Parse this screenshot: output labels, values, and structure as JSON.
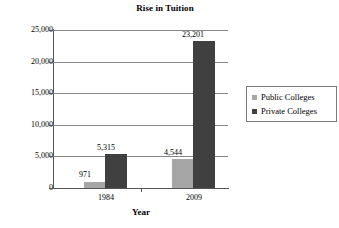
{
  "chart_data": {
    "type": "bar",
    "title": "Rise in Tuition",
    "xlabel": "Year",
    "ylabel": "Dollars",
    "categories": [
      "1984",
      "2009"
    ],
    "series": [
      {
        "name": "Public Colleges",
        "color": "#a6a6a6",
        "values": [
          971,
          4544
        ]
      },
      {
        "name": "Private Colleges",
        "color": "#404040",
        "values": [
          5315,
          23201
        ]
      }
    ],
    "value_labels": [
      {
        "text": "971",
        "value": 971
      },
      {
        "text": "5,315",
        "value": 5315
      },
      {
        "text": "4,544",
        "value": 4544
      },
      {
        "text": "23,201",
        "value": 23201
      }
    ],
    "ylim": [
      0,
      25000
    ],
    "ytick_values": [
      0,
      5000,
      10000,
      15000,
      20000,
      25000
    ],
    "ytick_labels": [
      "0",
      "5,000",
      "10,000",
      "15,000",
      "20,000",
      "25,000"
    ],
    "grid": true,
    "legend_position": "right"
  },
  "legend": {
    "items": [
      {
        "label": "Public Colleges",
        "color": "#a6a6a6"
      },
      {
        "label": "Private Colleges",
        "color": "#404040"
      }
    ]
  }
}
